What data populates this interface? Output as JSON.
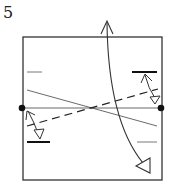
{
  "diagram": {
    "step_number": "5",
    "type": "origami-fold-step",
    "colors": {
      "stroke": "#333333",
      "background": "#ffffff",
      "dot": "#111111"
    },
    "elements": {
      "paper_square": "square sheet outline",
      "center_crease": "horizontal crease through center",
      "diagonal_crease": "thin diagonal crease",
      "dashed_valley_fold": "dashed valley-fold line",
      "reference_dots": [
        "left-edge-dot",
        "right-edge-dot"
      ],
      "short_marks": [
        "left-top-mark",
        "right-top-mark",
        "left-bottom-mark",
        "right-bottom-mark"
      ],
      "arrows": [
        "large-curved-fold-arrow",
        "left-small-fold-arrow",
        "right-small-fold-arrow"
      ]
    }
  }
}
